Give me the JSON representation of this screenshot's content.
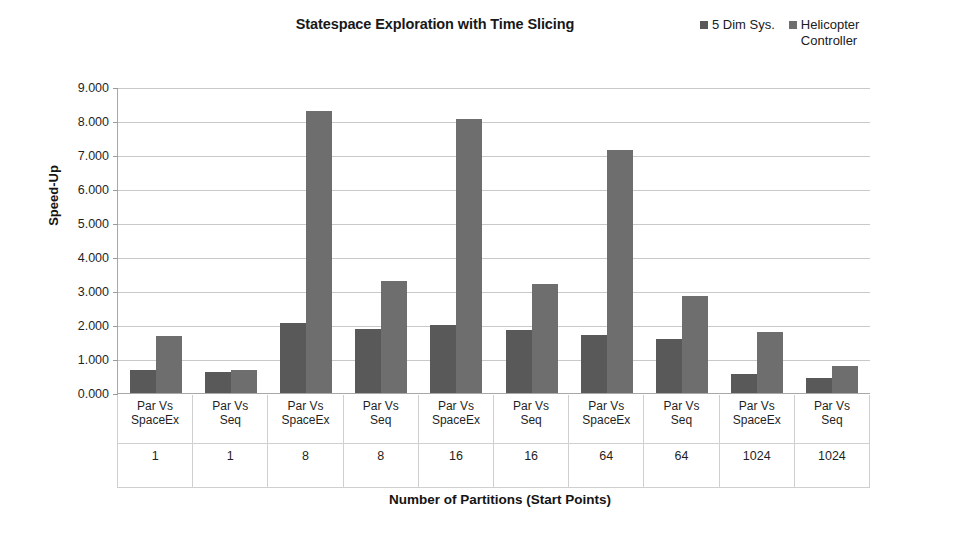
{
  "chart_data": {
    "type": "bar",
    "title": "Statespace Exploration with Time Slicing",
    "subtitle": "",
    "xlabel": "Number of Partitions (Start Points)",
    "ylabel": "Speed-Up",
    "ylim": [
      0,
      9
    ],
    "ytick_step": 1,
    "ytick_labels": [
      "0.000",
      "1.000",
      "2.000",
      "3.000",
      "4.000",
      "5.000",
      "6.000",
      "7.000",
      "8.000",
      "9.000"
    ],
    "grid": true,
    "legend_position": "top-right",
    "categories": [
      "Par Vs\nSpaceEx",
      "Par Vs\nSeq",
      "Par Vs\nSpaceEx",
      "Par Vs\nSeq",
      "Par Vs\nSpaceEx",
      "Par Vs\nSeq",
      "Par Vs\nSpaceEx",
      "Par Vs\nSeq",
      "Par Vs\nSpaceEx",
      "Par Vs\nSeq"
    ],
    "group_values": [
      "1",
      "1",
      "8",
      "8",
      "16",
      "16",
      "64",
      "64",
      "1024",
      "1024"
    ],
    "series": [
      {
        "name": "5 Dim Sys.",
        "color": "#595959",
        "values": [
          0.68,
          0.62,
          2.05,
          1.87,
          2.0,
          1.85,
          1.72,
          1.6,
          0.55,
          0.45
        ]
      },
      {
        "name": "Helicopter\nController",
        "color": "#6e6e6e",
        "values": [
          1.68,
          0.68,
          8.3,
          3.3,
          8.05,
          3.2,
          7.15,
          2.85,
          1.78,
          0.78
        ]
      }
    ]
  }
}
